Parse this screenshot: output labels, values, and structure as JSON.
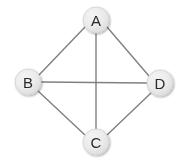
{
  "diagram": {
    "background_color": "#ffffff",
    "node_fill_color": "#e9e9e9",
    "node_stroke_color": "#d2d2d2",
    "node_label_color": "#2b2b2b",
    "edge_color": "#808080",
    "edge_width": 1.4,
    "node_radius": 13,
    "nodes": [
      {
        "id": "A",
        "label": "A",
        "cx": 96,
        "cy": 20
      },
      {
        "id": "B",
        "label": "B",
        "cx": 28,
        "cy": 82
      },
      {
        "id": "C",
        "label": "C",
        "cx": 96,
        "cy": 142
      },
      {
        "id": "D",
        "label": "D",
        "cx": 160,
        "cy": 83
      }
    ],
    "edges": [
      {
        "id": "A-B",
        "from": "A",
        "to": "B",
        "x1": 85,
        "y1": 27,
        "x2": 39,
        "y2": 75
      },
      {
        "id": "A-D",
        "from": "A",
        "to": "D",
        "x1": 107,
        "y1": 27,
        "x2": 149,
        "y2": 76
      },
      {
        "id": "A-C",
        "from": "A",
        "to": "C",
        "x1": 96,
        "y1": 33,
        "x2": 96,
        "y2": 129
      },
      {
        "id": "B-D",
        "from": "B",
        "to": "D",
        "x1": 41,
        "y1": 82,
        "x2": 147,
        "y2": 83
      },
      {
        "id": "B-C",
        "from": "B",
        "to": "C",
        "x1": 38,
        "y1": 91,
        "x2": 85,
        "y2": 135
      },
      {
        "id": "C-D",
        "from": "C",
        "to": "D",
        "x1": 107,
        "y1": 135,
        "x2": 151,
        "y2": 93
      }
    ]
  }
}
